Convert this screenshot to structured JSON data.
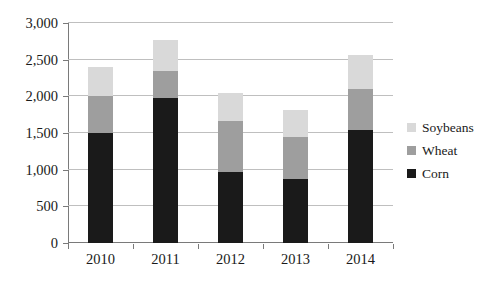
{
  "chart_data": {
    "type": "bar",
    "subtype": "stacked-bar",
    "title": "",
    "xlabel": "",
    "ylabel": "",
    "categories": [
      "2010",
      "2011",
      "2012",
      "2013",
      "2014"
    ],
    "series": [
      {
        "name": "Corn",
        "color": "#1a1a1a",
        "values": [
          1500,
          1980,
          970,
          870,
          1540
        ]
      },
      {
        "name": "Wheat",
        "color": "#9e9e9e",
        "values": [
          500,
          370,
          700,
          580,
          560
        ]
      },
      {
        "name": "Soybeans",
        "color": "#d9d9d9",
        "values": [
          400,
          420,
          380,
          370,
          460
        ]
      }
    ],
    "totals": [
      2400,
      2770,
      2050,
      1820,
      2560
    ],
    "ylim": [
      0,
      3000
    ],
    "y_ticks": [
      0,
      500,
      1000,
      1500,
      2000,
      2500,
      3000
    ],
    "y_tick_labels": [
      "0",
      "500",
      "1,000",
      "1,500",
      "2,000",
      "2,500",
      "3,000"
    ],
    "grid": true,
    "legend_position": "right"
  },
  "legend": {
    "items": [
      {
        "label": "Soybeans",
        "color": "#d9d9d9"
      },
      {
        "label": "Wheat",
        "color": "#9e9e9e"
      },
      {
        "label": "Corn",
        "color": "#1a1a1a"
      }
    ]
  },
  "colors": {
    "soybeans": "#d9d9d9",
    "wheat": "#9e9e9e",
    "corn": "#1a1a1a",
    "gridline": "#bfbfbf",
    "axis": "#7a7a7a",
    "text": "#1a1a1a",
    "background": "#ffffff"
  }
}
